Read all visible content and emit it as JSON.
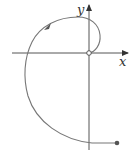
{
  "diagram": {
    "type": "parametric-spiral-curve",
    "axes": {
      "x_label": "x",
      "y_label": "y",
      "origin_px": [
        89,
        53
      ],
      "color": "#555555"
    },
    "curve": {
      "color": "#777777",
      "start": "origin (open circle)",
      "end": "filled dot at lower right",
      "direction": "counterclockwise, arrow on upper-left arc"
    },
    "start_marker": "open-circle",
    "end_marker": "filled-dot"
  }
}
